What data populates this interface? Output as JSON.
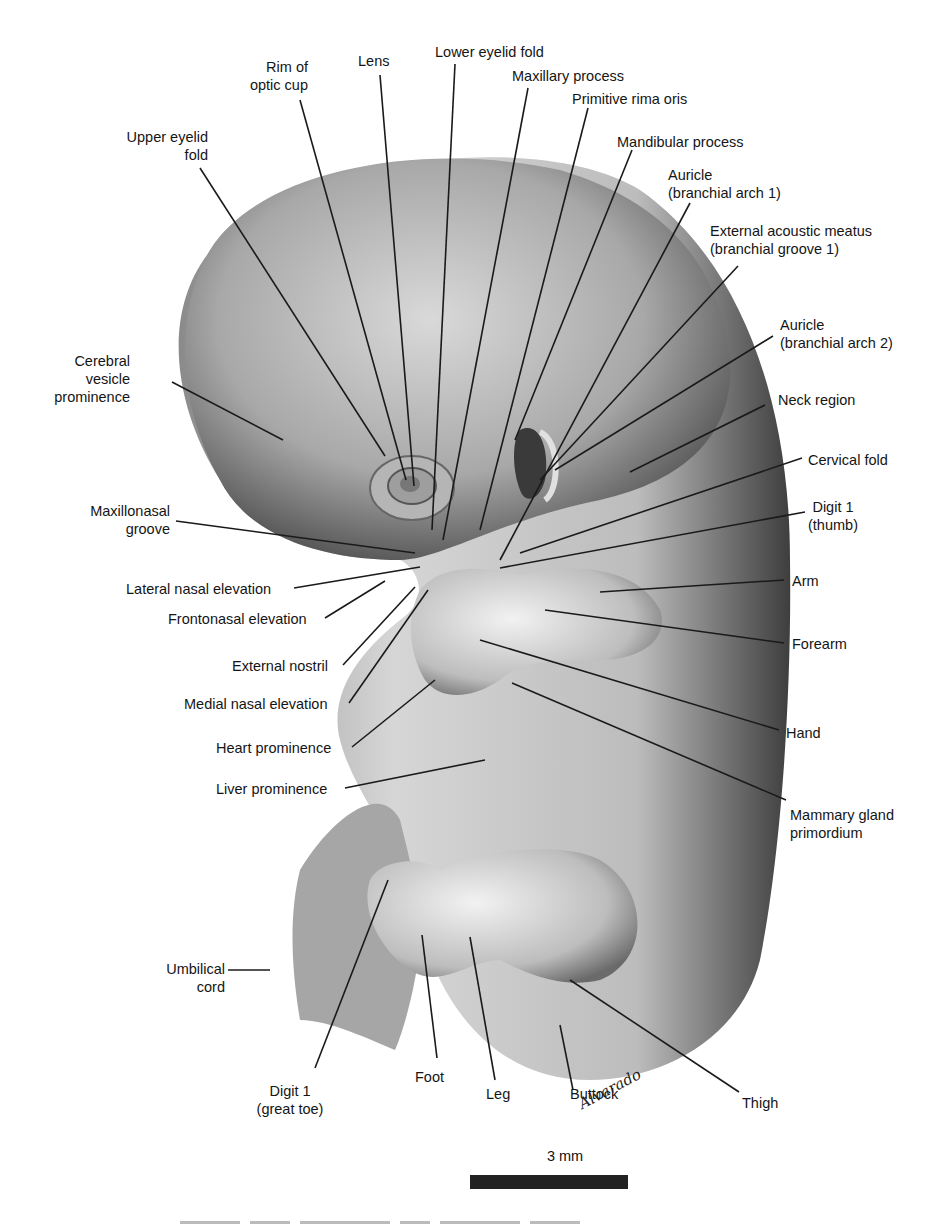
{
  "figure": {
    "type": "anatomical illustration",
    "signature": "Alvarado",
    "scale_bar": {
      "label": "3 mm",
      "color": "#222222"
    },
    "caption_visible": false
  },
  "labels": {
    "rim_optic_cup": "Rim of\noptic cup",
    "lens": "Lens",
    "lower_eyelid_fold": "Lower eyelid fold",
    "maxillary_process": "Maxillary process",
    "primitive_rima_oris": "Primitive rima oris",
    "upper_eyelid_fold": "Upper eyelid\nfold",
    "mandibular_process": "Mandibular process",
    "auricle_arch1": "Auricle\n(branchial arch 1)",
    "external_acoustic_meatus": "External acoustic meatus\n(branchial groove 1)",
    "auricle_arch2": "Auricle\n(branchial arch 2)",
    "cerebral_vesicle": "Cerebral\nvesicle\nprominence",
    "neck_region": "Neck region",
    "cervical_fold": "Cervical fold",
    "maxillonasal_groove": "Maxillonasal\ngroove",
    "digit1_thumb": "Digit 1\n(thumb)",
    "lateral_nasal_elevation": "Lateral nasal elevation",
    "arm": "Arm",
    "frontonasal_elevation": "Frontonasal elevation",
    "forearm": "Forearm",
    "external_nostril": "External nostril",
    "medial_nasal_elevation": "Medial nasal elevation",
    "heart_prominence": "Heart prominence",
    "hand": "Hand",
    "liver_prominence": "Liver prominence",
    "mammary_gland": "Mammary gland\nprimordium",
    "umbilical_cord": "Umbilical\ncord",
    "thigh": "Thigh",
    "digit1_great_toe": "Digit 1\n(great toe)",
    "foot": "Foot",
    "leg": "Leg",
    "buttock": "Buttock"
  }
}
